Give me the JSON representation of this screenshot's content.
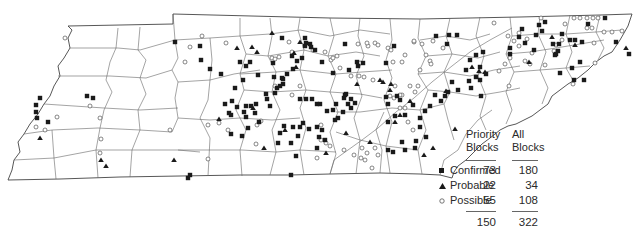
{
  "map": {
    "region": "Tennessee",
    "description": "County map of Tennessee showing atlas block records by breeding status",
    "county_line_color": "#555555",
    "symbol_color": "#1a1a1a"
  },
  "legend": {
    "columns": [
      {
        "line1": "Priority",
        "line2": "Blocks"
      },
      {
        "line1": "All",
        "line2": "Blocks"
      }
    ],
    "rows": [
      {
        "symbol": "filled-square",
        "label": "Confirmed",
        "priority": "73",
        "all": "180"
      },
      {
        "symbol": "filled-triangle",
        "label": "Probable",
        "priority": "22",
        "all": "34"
      },
      {
        "symbol": "open-circle",
        "label": "Possible",
        "priority": "55",
        "all": "108"
      }
    ],
    "totals": {
      "priority": "150",
      "all": "322"
    }
  },
  "markers": {
    "confirmed": [
      [
        175,
        42
      ],
      [
        200,
        46
      ],
      [
        201,
        60
      ],
      [
        210,
        69
      ],
      [
        221,
        74
      ],
      [
        246,
        66
      ],
      [
        282,
        38
      ],
      [
        292,
        56
      ],
      [
        297,
        61
      ],
      [
        302,
        58
      ],
      [
        305,
        46
      ],
      [
        305,
        38
      ],
      [
        306,
        43
      ],
      [
        310,
        44
      ],
      [
        311,
        47
      ],
      [
        315,
        50
      ],
      [
        322,
        62
      ],
      [
        243,
        80
      ],
      [
        235,
        88
      ],
      [
        232,
        101
      ],
      [
        225,
        104
      ],
      [
        229,
        113
      ],
      [
        231,
        115
      ],
      [
        237,
        107
      ],
      [
        244,
        112
      ],
      [
        246,
        106
      ],
      [
        251,
        106
      ],
      [
        255,
        113
      ],
      [
        256,
        104
      ],
      [
        266,
        94
      ],
      [
        277,
        88
      ],
      [
        282,
        78
      ],
      [
        283,
        84
      ],
      [
        287,
        74
      ],
      [
        293,
        69
      ],
      [
        258,
        75
      ],
      [
        231,
        134
      ],
      [
        248,
        128
      ],
      [
        259,
        122
      ],
      [
        267,
        99
      ],
      [
        270,
        106
      ],
      [
        275,
        93
      ],
      [
        283,
        79
      ],
      [
        300,
        99
      ],
      [
        306,
        99
      ],
      [
        312,
        99
      ],
      [
        317,
        104
      ],
      [
        274,
        77
      ],
      [
        273,
        63
      ],
      [
        250,
        62
      ],
      [
        240,
        62
      ],
      [
        280,
        86
      ],
      [
        336,
        104
      ],
      [
        344,
        98
      ],
      [
        345,
        95
      ],
      [
        320,
        104
      ],
      [
        333,
        73
      ],
      [
        346,
        94
      ],
      [
        348,
        104
      ],
      [
        351,
        99
      ],
      [
        355,
        103
      ],
      [
        351,
        108
      ],
      [
        343,
        112
      ],
      [
        338,
        118
      ],
      [
        333,
        110
      ],
      [
        327,
        111
      ],
      [
        335,
        120
      ],
      [
        345,
        44
      ],
      [
        349,
        70
      ],
      [
        394,
        46
      ],
      [
        386,
        63
      ],
      [
        363,
        63
      ],
      [
        357,
        62
      ],
      [
        358,
        66
      ],
      [
        388,
        104
      ],
      [
        386,
        97
      ],
      [
        436,
        36
      ],
      [
        447,
        44
      ],
      [
        449,
        35
      ],
      [
        457,
        35
      ],
      [
        466,
        70
      ],
      [
        470,
        60
      ],
      [
        471,
        88
      ],
      [
        476,
        77
      ],
      [
        469,
        81
      ],
      [
        480,
        67
      ],
      [
        476,
        55
      ],
      [
        483,
        52
      ],
      [
        480,
        80
      ],
      [
        486,
        74
      ],
      [
        481,
        96
      ],
      [
        452,
        82
      ],
      [
        458,
        90
      ],
      [
        441,
        101
      ],
      [
        435,
        95
      ],
      [
        445,
        96
      ],
      [
        448,
        92
      ],
      [
        430,
        106
      ],
      [
        425,
        111
      ],
      [
        420,
        118
      ],
      [
        420,
        127
      ],
      [
        426,
        137
      ],
      [
        416,
        141
      ],
      [
        415,
        148
      ],
      [
        405,
        150
      ],
      [
        393,
        152
      ],
      [
        388,
        150
      ],
      [
        395,
        116
      ],
      [
        405,
        115
      ],
      [
        402,
        142
      ],
      [
        400,
        100
      ],
      [
        397,
        96
      ],
      [
        388,
        122
      ],
      [
        413,
        105
      ],
      [
        510,
        54
      ],
      [
        510,
        48
      ],
      [
        519,
        37
      ],
      [
        522,
        29
      ],
      [
        525,
        43
      ],
      [
        534,
        50
      ],
      [
        536,
        35
      ],
      [
        539,
        25
      ],
      [
        545,
        22
      ],
      [
        542,
        31
      ],
      [
        553,
        44
      ],
      [
        555,
        55
      ],
      [
        559,
        44
      ],
      [
        570,
        40
      ],
      [
        575,
        40
      ],
      [
        582,
        42
      ],
      [
        588,
        24
      ],
      [
        605,
        18
      ],
      [
        616,
        42
      ],
      [
        629,
        54
      ],
      [
        580,
        62
      ],
      [
        584,
        80
      ],
      [
        574,
        80
      ],
      [
        572,
        68
      ],
      [
        560,
        73
      ],
      [
        556,
        54
      ],
      [
        558,
        51
      ],
      [
        562,
        34
      ],
      [
        36,
        105
      ],
      [
        36,
        112
      ],
      [
        37,
        118
      ],
      [
        40,
        98
      ],
      [
        48,
        122
      ],
      [
        87,
        96
      ],
      [
        93,
        98
      ],
      [
        188,
        178
      ],
      [
        190,
        175
      ],
      [
        242,
        136
      ],
      [
        246,
        117
      ],
      [
        280,
        133
      ],
      [
        291,
        143
      ],
      [
        278,
        143
      ],
      [
        284,
        126
      ],
      [
        293,
        127
      ],
      [
        300,
        127
      ],
      [
        303,
        123
      ],
      [
        298,
        136
      ],
      [
        296,
        156
      ],
      [
        309,
        129
      ],
      [
        317,
        127
      ],
      [
        322,
        130
      ],
      [
        319,
        137
      ],
      [
        325,
        140
      ],
      [
        317,
        148
      ],
      [
        291,
        175
      ]
    ],
    "probable": [
      [
        237,
        48
      ],
      [
        252,
        47
      ],
      [
        272,
        33
      ],
      [
        300,
        42
      ],
      [
        294,
        53
      ],
      [
        296,
        67
      ],
      [
        357,
        84
      ],
      [
        380,
        80
      ],
      [
        383,
        82
      ],
      [
        391,
        84
      ],
      [
        390,
        90
      ],
      [
        446,
        91
      ],
      [
        410,
        101
      ],
      [
        455,
        129
      ],
      [
        479,
        71
      ],
      [
        485,
        72
      ],
      [
        575,
        45
      ],
      [
        626,
        48
      ],
      [
        552,
        37
      ],
      [
        529,
        62
      ],
      [
        433,
        148
      ],
      [
        424,
        155
      ],
      [
        472,
        67
      ],
      [
        101,
        160
      ],
      [
        174,
        160
      ],
      [
        219,
        119
      ],
      [
        264,
        148
      ],
      [
        285,
        130
      ],
      [
        40,
        138
      ],
      [
        106,
        166
      ],
      [
        370,
        142
      ],
      [
        326,
        153
      ],
      [
        346,
        133
      ],
      [
        395,
        122
      ],
      [
        400,
        115
      ],
      [
        253,
        108
      ],
      [
        257,
        52
      ]
    ],
    "possible": [
      [
        202,
        36
      ],
      [
        190,
        47
      ],
      [
        226,
        43
      ],
      [
        272,
        58
      ],
      [
        289,
        42
      ],
      [
        275,
        59
      ],
      [
        279,
        57
      ],
      [
        292,
        52
      ],
      [
        313,
        50
      ],
      [
        325,
        52
      ],
      [
        358,
        44
      ],
      [
        368,
        46
      ],
      [
        375,
        43
      ],
      [
        378,
        45
      ],
      [
        337,
        56
      ],
      [
        331,
        60
      ],
      [
        340,
        68
      ],
      [
        351,
        76
      ],
      [
        359,
        76
      ],
      [
        364,
        77
      ],
      [
        373,
        80
      ],
      [
        360,
        63
      ],
      [
        367,
        43
      ],
      [
        388,
        48
      ],
      [
        391,
        50
      ],
      [
        414,
        42
      ],
      [
        426,
        55
      ],
      [
        430,
        61
      ],
      [
        431,
        64
      ],
      [
        420,
        70
      ],
      [
        418,
        86
      ],
      [
        410,
        86
      ],
      [
        415,
        92
      ],
      [
        400,
        108
      ],
      [
        390,
        96
      ],
      [
        394,
        98
      ],
      [
        402,
        95
      ],
      [
        402,
        62
      ],
      [
        414,
        41
      ],
      [
        494,
        23
      ],
      [
        508,
        36
      ],
      [
        514,
        41
      ],
      [
        519,
        33
      ],
      [
        532,
        53
      ],
      [
        541,
        18
      ],
      [
        565,
        24
      ],
      [
        574,
        18
      ],
      [
        580,
        18
      ],
      [
        587,
        18
      ],
      [
        593,
        18
      ],
      [
        598,
        18
      ],
      [
        587,
        28
      ],
      [
        592,
        28
      ],
      [
        612,
        32
      ],
      [
        622,
        31
      ],
      [
        604,
        32
      ],
      [
        594,
        43
      ],
      [
        595,
        63
      ],
      [
        573,
        84
      ],
      [
        554,
        51
      ],
      [
        525,
        61
      ],
      [
        510,
        58
      ],
      [
        505,
        64
      ],
      [
        509,
        86
      ],
      [
        499,
        71
      ],
      [
        519,
        46
      ],
      [
        530,
        64
      ],
      [
        545,
        65
      ],
      [
        527,
        39
      ],
      [
        556,
        45
      ],
      [
        562,
        40
      ],
      [
        36,
        127
      ],
      [
        45,
        130
      ],
      [
        57,
        117
      ],
      [
        65,
        38
      ],
      [
        100,
        118
      ],
      [
        100,
        153
      ],
      [
        90,
        106
      ],
      [
        101,
        139
      ],
      [
        170,
        130
      ],
      [
        185,
        62
      ],
      [
        208,
        159
      ],
      [
        257,
        125
      ],
      [
        261,
        121
      ],
      [
        256,
        144
      ],
      [
        208,
        125
      ],
      [
        219,
        123
      ],
      [
        228,
        130
      ],
      [
        333,
        58
      ],
      [
        321,
        125
      ],
      [
        321,
        140
      ],
      [
        317,
        158
      ],
      [
        326,
        143
      ],
      [
        330,
        146
      ],
      [
        344,
        150
      ],
      [
        354,
        155
      ],
      [
        362,
        148
      ],
      [
        372,
        168
      ],
      [
        365,
        160
      ],
      [
        378,
        155
      ],
      [
        393,
        62
      ],
      [
        395,
        86
      ],
      [
        408,
        122
      ],
      [
        413,
        130
      ],
      [
        400,
        95
      ],
      [
        405,
        108
      ],
      [
        300,
        86
      ],
      [
        292,
        95
      ],
      [
        275,
        86
      ],
      [
        375,
        148
      ],
      [
        367,
        153
      ],
      [
        361,
        158
      ],
      [
        405,
        55
      ],
      [
        422,
        44
      ],
      [
        433,
        41
      ],
      [
        443,
        48
      ]
    ]
  }
}
